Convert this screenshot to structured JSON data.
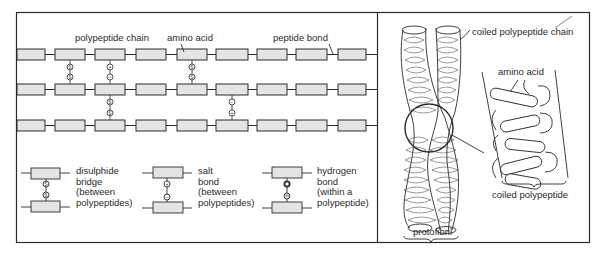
{
  "figure": {
    "left_panel": {
      "labels": {
        "polypeptide_chain": "polypeptide chain",
        "amino_acid": "amino acid",
        "peptide_bond": "peptide bond"
      },
      "chains": {
        "rows": 3,
        "amino_acids_per_row": 9
      },
      "bonds": [
        {
          "between_rows": [
            1,
            2
          ],
          "position": 2,
          "type": "disulphide",
          "symbols": [
            "S",
            "S"
          ]
        },
        {
          "between_rows": [
            1,
            2
          ],
          "position": 3,
          "type": "salt",
          "symbols": [
            "+",
            "−"
          ]
        },
        {
          "between_rows": [
            1,
            2
          ],
          "position": 5,
          "type": "disulphide",
          "symbols": [
            "S",
            "S"
          ]
        },
        {
          "between_rows": [
            2,
            3
          ],
          "position": 3,
          "type": "disulphide",
          "symbols": [
            "S",
            "S"
          ]
        },
        {
          "between_rows": [
            2,
            3
          ],
          "position": 6,
          "type": "salt",
          "symbols": [
            "−",
            "+"
          ]
        }
      ],
      "legend": [
        {
          "key": "disulphide",
          "text": "disulphide\nbridge\n(between\npolypeptides)"
        },
        {
          "key": "salt",
          "text": "salt\nbond\n(between\npolypeptides)"
        },
        {
          "key": "hydrogen",
          "text": "hydrogen\nbond\n(within a\npolypeptide)"
        }
      ]
    },
    "right_panel": {
      "labels": {
        "coiled_polypeptide_chain": "coiled polypeptide chain",
        "amino_acid": "amino acid",
        "coiled_polypeptide": "coiled polypeptide",
        "protofibril": "protofibril"
      }
    },
    "colors": {
      "line": "#2a2a2a",
      "box_fill": "#e4e4e4",
      "background": "#ffffff"
    }
  }
}
